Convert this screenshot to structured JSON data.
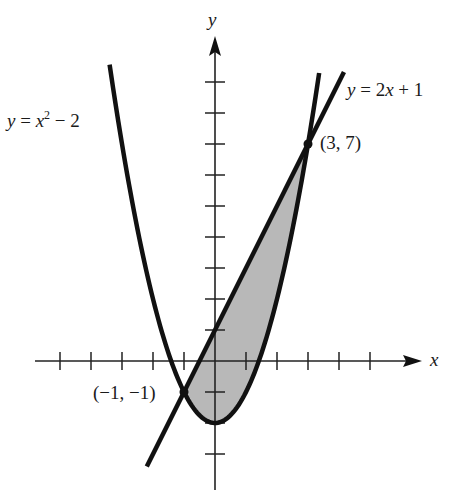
{
  "chart_data": {
    "type": "line",
    "title": "",
    "xlabel": "x",
    "ylabel": "y",
    "xlim": [
      -5,
      6
    ],
    "ylim": [
      -4,
      10
    ],
    "grid": false,
    "x_ticks": [
      -5,
      -4,
      -3,
      -2,
      -1,
      1,
      2,
      3,
      4,
      5
    ],
    "y_ticks": [
      -3,
      -2,
      -1,
      1,
      2,
      3,
      4,
      5,
      6,
      7,
      8,
      9
    ],
    "series": [
      {
        "name": "y = x^2 - 2",
        "equation": "x^2 - 2",
        "x_range": [
          -3.4,
          3.36
        ],
        "stroke": "#111111"
      },
      {
        "name": "y = 2x + 1",
        "equation": "2x + 1",
        "x_range": [
          -2.2,
          4.16
        ],
        "stroke": "#111111"
      }
    ],
    "shaded_region": {
      "between": [
        "y = 2x + 1",
        "y = x^2 - 2"
      ],
      "x_from": -1,
      "x_to": 3,
      "fill": "#b8b8b8"
    },
    "annotations": [
      {
        "text": "(3, 7)",
        "x": 3,
        "y": 7
      },
      {
        "text": "(-1, -1)",
        "x": -1,
        "y": -1
      }
    ]
  },
  "labels": {
    "axis_x": "x",
    "axis_y": "y",
    "parabola_y": "y",
    "parabola_eq": " = x",
    "parabola_exp": "2",
    "parabola_tail": " − 2",
    "line_y": "y",
    "line_eq": " = 2",
    "line_x": "x",
    "line_tail": " + 1",
    "point_top": "(3, 7)",
    "point_bottom": "(−1, −1)"
  }
}
